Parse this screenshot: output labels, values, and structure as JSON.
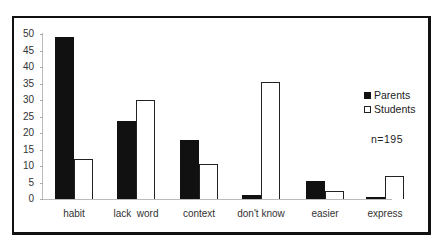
{
  "chart_data": {
    "type": "bar",
    "title": "",
    "xlabel": "",
    "ylabel": "",
    "ylim": [
      0,
      50
    ],
    "yticks": [
      0,
      5,
      10,
      15,
      20,
      25,
      30,
      35,
      40,
      45,
      50
    ],
    "categories": [
      "habit",
      "lack  word",
      "context",
      "don't know",
      "easier",
      "express"
    ],
    "series": [
      {
        "name": "Parents",
        "color": "#111111",
        "values": [
          49,
          23.5,
          18,
          1.3,
          5.5,
          0.5
        ]
      },
      {
        "name": "Students",
        "color": "#ffffff",
        "values": [
          12,
          30,
          10.5,
          35.5,
          2.3,
          7
        ]
      }
    ],
    "legend": {
      "position": "right",
      "entries": [
        "Parents",
        "Students"
      ]
    },
    "annotations": [
      "n=195"
    ],
    "grid": false
  },
  "legend": {
    "parents": "Parents",
    "students": "Students"
  },
  "note": "n=195"
}
